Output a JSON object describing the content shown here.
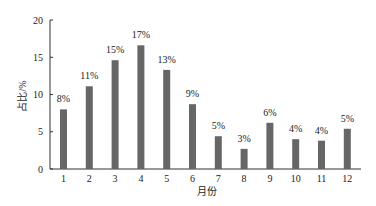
{
  "chart_data": {
    "type": "bar",
    "title": "",
    "xlabel": "月份",
    "ylabel": "占比/%",
    "categories": [
      "1",
      "2",
      "3",
      "4",
      "5",
      "6",
      "7",
      "8",
      "9",
      "10",
      "11",
      "12"
    ],
    "values": [
      8.0,
      11.1,
      14.6,
      16.6,
      13.3,
      8.7,
      4.4,
      2.7,
      6.2,
      4.0,
      3.8,
      5.4
    ],
    "data_labels": [
      "8%",
      "11%",
      "15%",
      "17%",
      "13%",
      "9%",
      "5%",
      "3%",
      "6%",
      "4%",
      "4%",
      "5%"
    ],
    "ylim": [
      0,
      20
    ],
    "yticks": [
      0,
      5,
      10,
      15,
      20
    ],
    "grid": false,
    "legend": null,
    "bar_color": "#666666",
    "axis_color": "#333333"
  }
}
